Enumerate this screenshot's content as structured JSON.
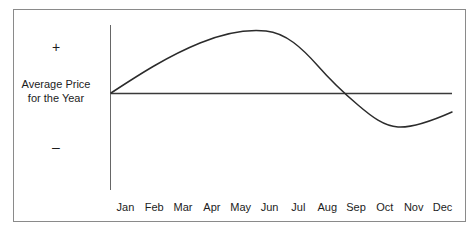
{
  "chart_data": {
    "type": "line",
    "title": "",
    "subtitle": "",
    "xlabel": "",
    "ylabel": "Average Price for the Year",
    "ylabel_line1": "Average Price",
    "ylabel_line2": "for the Year",
    "positive_marker": "+",
    "negative_marker": "–",
    "grid": false,
    "legend": null,
    "legend_position": "none",
    "axis_color": "#555555",
    "line_color": "#2b2b2b",
    "background_color": "#ffffff",
    "border_color": "#8a8a8a",
    "categories": [
      "Jan",
      "Feb",
      "Mar",
      "Apr",
      "May",
      "Jun",
      "Jul",
      "Aug",
      "Sep",
      "Oct",
      "Nov",
      "Dec"
    ],
    "ylim": [
      -1.6,
      2.4
    ],
    "ytick_labels": [
      "+",
      "Average Price for the Year",
      "–"
    ],
    "baseline_value": 0,
    "baseline_label": "Average Price for the Year",
    "series": [
      {
        "name": "Seasonal Price Deviation",
        "values": [
          0.0,
          0.72,
          1.28,
          1.72,
          1.98,
          2.08,
          1.96,
          1.45,
          0.42,
          -0.78,
          -1.22,
          -0.73
        ],
        "annotations": [
          {
            "label": "peak",
            "x": "Jun",
            "value": 2.08
          },
          {
            "label": "crosses average",
            "x": "Sep",
            "value": 0.0
          },
          {
            "label": "trough",
            "x": "Nov",
            "value": -1.22
          }
        ]
      }
    ]
  },
  "axis": {
    "months": [
      "Jan",
      "Feb",
      "Mar",
      "Apr",
      "May",
      "Jun",
      "Jul",
      "Aug",
      "Sep",
      "Oct",
      "Nov",
      "Dec"
    ],
    "plus": "+",
    "minus": "–",
    "y_title_line1": "Average Price",
    "y_title_line2": "for the Year"
  }
}
